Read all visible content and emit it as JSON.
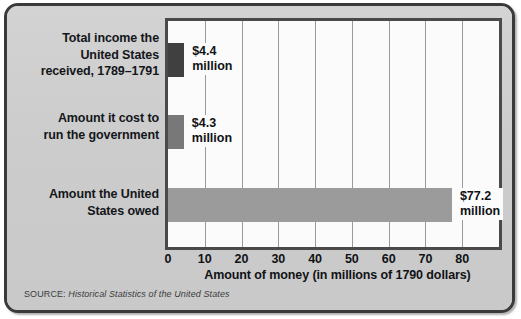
{
  "chart_data": {
    "type": "bar",
    "orientation": "horizontal",
    "title": "",
    "categories": [
      "Total income the United States received, 1789–1791",
      "Amount it cost to run the government",
      "Amount the United States owed"
    ],
    "values": [
      4.4,
      4.3,
      77.2
    ],
    "data_labels": [
      "$4.4 million",
      "$4.3 million",
      "$77.2 million"
    ],
    "xlabel": "Amount of money (in millions of 1790 dollars)",
    "ylabel": "",
    "xlim": [
      0,
      90
    ],
    "xticks": [
      0,
      10,
      20,
      30,
      40,
      50,
      60,
      70,
      80
    ],
    "xticklabels": [
      "0",
      "10",
      "20",
      "30",
      "40",
      "50",
      "60",
      "70",
      "80"
    ],
    "grid": true,
    "grid_axis": "x",
    "legend": false,
    "bar_colors": [
      "#404040",
      "#787878",
      "#9b9b9b"
    ],
    "source": "SOURCE: Historical Statistics of the United States"
  },
  "categories": [
    {
      "lines": [
        "Total income the",
        "United States",
        "received, 1789–1791"
      ],
      "value_amount": "$4.4",
      "value_unit": "million"
    },
    {
      "lines": [
        "Amount it cost to",
        "run the government"
      ],
      "value_amount": "$4.3",
      "value_unit": "million"
    },
    {
      "lines": [
        "Amount the United",
        "States owed"
      ],
      "value_amount": "$77.2",
      "value_unit": "million"
    }
  ],
  "axis": {
    "title": "Amount of money (in millions of 1790 dollars)",
    "ticks": [
      "0",
      "10",
      "20",
      "30",
      "40",
      "50",
      "60",
      "70",
      "80"
    ]
  },
  "source": {
    "label": "SOURCE:",
    "title": "Historical Statistics of the United States"
  },
  "colors": {
    "card_background": "#cfcfcf",
    "card_border": "#3a3a3a",
    "plot_background": "#fbfbfb",
    "plot_border": "#4a4a4a",
    "gridline": "#9a9a9a",
    "bar_1": "#404040",
    "bar_2": "#787878",
    "bar_3": "#9b9b9b",
    "text": "#101215"
  }
}
